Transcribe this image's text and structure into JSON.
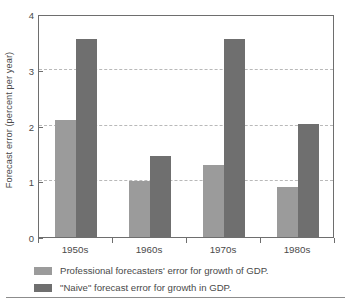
{
  "chart_data": {
    "type": "bar",
    "title": "",
    "xlabel": "",
    "ylabel": "Forecast error (percent per year)",
    "categories": [
      "1950s",
      "1960s",
      "1970s",
      "1980s"
    ],
    "series": [
      {
        "name": "Professional forecasters' error for growth of GDP.",
        "values": [
          2.1,
          1.0,
          1.3,
          0.9
        ],
        "color": "#9b9b9b"
      },
      {
        "name": "\"Naive\" forecast error for growth in GDP.",
        "values": [
          3.55,
          1.45,
          3.55,
          2.03
        ],
        "color": "#6f6f6f"
      }
    ],
    "ylim": [
      0,
      4
    ],
    "yticks": [
      "0",
      "1",
      "2",
      "3",
      "4"
    ],
    "ytick_values": [
      0,
      1,
      2,
      3,
      4
    ],
    "grid": "horizontal-dashed",
    "legend_position": "bottom-left"
  },
  "legend": {
    "entries": [
      "Professional forecasters' error for growth of GDP.",
      "\"Naive\" forecast error for growth in GDP."
    ]
  }
}
